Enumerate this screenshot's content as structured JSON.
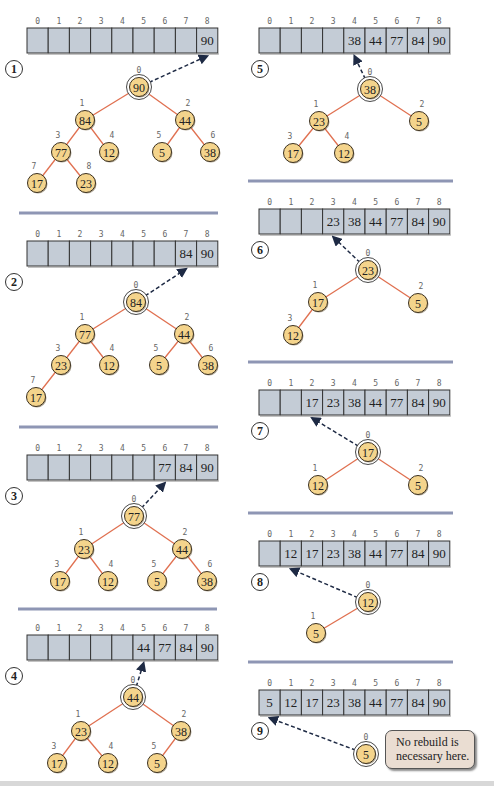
{
  "colors": {
    "array_fill": "#c4ccd6",
    "array_border": "#333333",
    "node_fill": "#f4d48c",
    "node_border": "#3a3020",
    "edge": "#e07050",
    "divider": "#8e96b4",
    "arrow": "#1e2a44",
    "callout_fill": "#eaddd2"
  },
  "array_indices": [
    "0",
    "1",
    "2",
    "3",
    "4",
    "5",
    "6",
    "7",
    "8"
  ],
  "panels": [
    {
      "step": "1",
      "col": "left",
      "top": 0,
      "array": [
        "",
        "",
        "",
        "",
        "",
        "",
        "",
        "",
        "90"
      ],
      "arrow_to_cell": 8,
      "nodes": [
        {
          "i": "0",
          "v": "90",
          "x": 139,
          "y": 87
        },
        {
          "i": "1",
          "v": "84",
          "x": 85,
          "y": 120
        },
        {
          "i": "2",
          "v": "44",
          "x": 185,
          "y": 120
        },
        {
          "i": "3",
          "v": "77",
          "x": 61,
          "y": 152
        },
        {
          "i": "4",
          "v": "12",
          "x": 109,
          "y": 152
        },
        {
          "i": "5",
          "v": "5",
          "x": 162,
          "y": 152
        },
        {
          "i": "6",
          "v": "38",
          "x": 210,
          "y": 152
        },
        {
          "i": "7",
          "v": "17",
          "x": 37,
          "y": 183
        },
        {
          "i": "8",
          "v": "23",
          "x": 86,
          "y": 183
        }
      ],
      "edges": [
        [
          0,
          1
        ],
        [
          0,
          2
        ],
        [
          1,
          3
        ],
        [
          1,
          4
        ],
        [
          2,
          5
        ],
        [
          2,
          6
        ],
        [
          3,
          7
        ],
        [
          3,
          8
        ]
      ]
    },
    {
      "step": "2",
      "col": "left",
      "top": 213,
      "array": [
        "",
        "",
        "",
        "",
        "",
        "",
        "",
        "84",
        "90"
      ],
      "arrow_to_cell": 7,
      "nodes": [
        {
          "i": "0",
          "v": "84",
          "x": 136,
          "y": 302
        },
        {
          "i": "1",
          "v": "77",
          "x": 85,
          "y": 334
        },
        {
          "i": "2",
          "v": "44",
          "x": 184,
          "y": 334
        },
        {
          "i": "3",
          "v": "23",
          "x": 61,
          "y": 365
        },
        {
          "i": "4",
          "v": "12",
          "x": 109,
          "y": 365
        },
        {
          "i": "5",
          "v": "5",
          "x": 159,
          "y": 365
        },
        {
          "i": "6",
          "v": "38",
          "x": 208,
          "y": 365
        },
        {
          "i": "7",
          "v": "17",
          "x": 36,
          "y": 397
        }
      ],
      "edges": [
        [
          0,
          1
        ],
        [
          0,
          2
        ],
        [
          1,
          3
        ],
        [
          1,
          4
        ],
        [
          2,
          5
        ],
        [
          2,
          6
        ],
        [
          3,
          7
        ]
      ]
    },
    {
      "step": "3",
      "col": "left",
      "top": 427,
      "array": [
        "",
        "",
        "",
        "",
        "",
        "",
        "77",
        "84",
        "90"
      ],
      "arrow_to_cell": 6,
      "nodes": [
        {
          "i": "0",
          "v": "77",
          "x": 134,
          "y": 516
        },
        {
          "i": "1",
          "v": "23",
          "x": 84,
          "y": 549
        },
        {
          "i": "2",
          "v": "44",
          "x": 182,
          "y": 549
        },
        {
          "i": "3",
          "v": "17",
          "x": 60,
          "y": 581
        },
        {
          "i": "4",
          "v": "12",
          "x": 108,
          "y": 581
        },
        {
          "i": "5",
          "v": "5",
          "x": 157,
          "y": 581
        },
        {
          "i": "6",
          "v": "38",
          "x": 207,
          "y": 581
        }
      ],
      "edges": [
        [
          0,
          1
        ],
        [
          0,
          2
        ],
        [
          1,
          3
        ],
        [
          1,
          4
        ],
        [
          2,
          5
        ],
        [
          2,
          6
        ]
      ]
    },
    {
      "step": "4",
      "col": "left",
      "top": 607,
      "array": [
        "",
        "",
        "",
        "",
        "",
        "44",
        "77",
        "84",
        "90"
      ],
      "arrow_to_cell": 5,
      "nodes": [
        {
          "i": "0",
          "v": "44",
          "x": 133,
          "y": 697
        },
        {
          "i": "1",
          "v": "23",
          "x": 81,
          "y": 731
        },
        {
          "i": "2",
          "v": "38",
          "x": 181,
          "y": 731
        },
        {
          "i": "3",
          "v": "17",
          "x": 57,
          "y": 763
        },
        {
          "i": "4",
          "v": "12",
          "x": 108,
          "y": 763
        },
        {
          "i": "5",
          "v": "5",
          "x": 157,
          "y": 763
        }
      ],
      "edges": [
        [
          0,
          1
        ],
        [
          0,
          2
        ],
        [
          1,
          3
        ],
        [
          1,
          4
        ],
        [
          2,
          5
        ]
      ]
    },
    {
      "step": "5",
      "col": "right",
      "top": 0,
      "array": [
        "",
        "",
        "",
        "",
        "38",
        "44",
        "77",
        "84",
        "90"
      ],
      "arrow_to_cell": 4,
      "nodes": [
        {
          "i": "0",
          "v": "38",
          "x": 370,
          "y": 89
        },
        {
          "i": "1",
          "v": "23",
          "x": 319,
          "y": 121
        },
        {
          "i": "2",
          "v": "5",
          "x": 419,
          "y": 121
        },
        {
          "i": "3",
          "v": "17",
          "x": 293,
          "y": 153
        },
        {
          "i": "4",
          "v": "12",
          "x": 344,
          "y": 153
        }
      ],
      "edges": [
        [
          0,
          1
        ],
        [
          0,
          2
        ],
        [
          1,
          3
        ],
        [
          1,
          4
        ]
      ]
    },
    {
      "step": "6",
      "col": "right",
      "top": 181,
      "array": [
        "",
        "",
        "",
        "23",
        "38",
        "44",
        "77",
        "84",
        "90"
      ],
      "arrow_to_cell": 3,
      "nodes": [
        {
          "i": "0",
          "v": "23",
          "x": 368,
          "y": 270
        },
        {
          "i": "1",
          "v": "17",
          "x": 318,
          "y": 302
        },
        {
          "i": "2",
          "v": "5",
          "x": 418,
          "y": 303
        },
        {
          "i": "3",
          "v": "12",
          "x": 293,
          "y": 335
        }
      ],
      "edges": [
        [
          0,
          1
        ],
        [
          0,
          2
        ],
        [
          1,
          3
        ]
      ]
    },
    {
      "step": "7",
      "col": "right",
      "top": 362,
      "array": [
        "",
        "",
        "17",
        "23",
        "38",
        "44",
        "77",
        "84",
        "90"
      ],
      "arrow_to_cell": 2,
      "nodes": [
        {
          "i": "0",
          "v": "17",
          "x": 368,
          "y": 452
        },
        {
          "i": "1",
          "v": "12",
          "x": 318,
          "y": 485
        },
        {
          "i": "2",
          "v": "5",
          "x": 418,
          "y": 485
        }
      ],
      "edges": [
        [
          0,
          1
        ],
        [
          0,
          2
        ]
      ]
    },
    {
      "step": "8",
      "col": "right",
      "top": 513,
      "array": [
        "",
        "12",
        "17",
        "23",
        "38",
        "44",
        "77",
        "84",
        "90"
      ],
      "arrow_to_cell": 1,
      "nodes": [
        {
          "i": "0",
          "v": "12",
          "x": 368,
          "y": 602
        },
        {
          "i": "1",
          "v": "5",
          "x": 316,
          "y": 633
        }
      ],
      "edges": [
        [
          0,
          1
        ]
      ]
    },
    {
      "step": "9",
      "col": "right",
      "top": 662,
      "array": [
        "5",
        "12",
        "17",
        "23",
        "38",
        "44",
        "77",
        "84",
        "90"
      ],
      "arrow_to_cell": 0,
      "nodes": [
        {
          "i": "0",
          "v": "5",
          "x": 366,
          "y": 754
        }
      ],
      "edges": []
    }
  ],
  "dividers": [
    {
      "x1": 19,
      "x2": 218,
      "y": 213
    },
    {
      "x1": 19,
      "x2": 218,
      "y": 427
    },
    {
      "x1": 18,
      "x2": 217,
      "y": 609
    },
    {
      "x1": 248,
      "x2": 453,
      "y": 181
    },
    {
      "x1": 248,
      "x2": 453,
      "y": 362
    },
    {
      "x1": 248,
      "x2": 453,
      "y": 513
    },
    {
      "x1": 248,
      "x2": 453,
      "y": 662
    }
  ],
  "callout": {
    "line1": "No rebuild is",
    "line2": "necessary here."
  }
}
